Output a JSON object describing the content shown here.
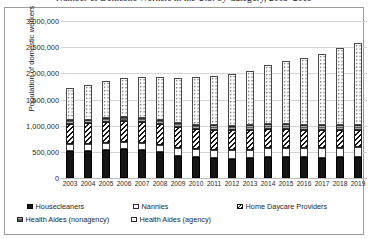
{
  "chart_data": {
    "type": "bar",
    "subtype": "stacked-column",
    "title": "Number of Domestic Workers in the U.S. by Category, 2003–2019",
    "xlabel": "",
    "ylabel": "Population of domestic workers",
    "ylim": [
      0,
      3000000
    ],
    "ytick_labels": [
      "3,000,000",
      "2,500,000",
      "2,000,000",
      "1,500,000",
      "1,000,000",
      "500,000",
      "0"
    ],
    "ytick_values": [
      3000000,
      2500000,
      2000000,
      1500000,
      1000000,
      500000,
      0
    ],
    "grid": true,
    "legend_position": "bottom",
    "categories": [
      "2003",
      "2004",
      "2005",
      "2006",
      "2007",
      "2008",
      "2009",
      "2010",
      "2011",
      "2012",
      "2013",
      "2014",
      "2015",
      "2016",
      "2017",
      "2018",
      "2019"
    ],
    "series": [
      {
        "name": "Housecleaners",
        "pattern": "solid-black",
        "values": [
          520000,
          520000,
          540000,
          545000,
          530000,
          500000,
          430000,
          400000,
          380000,
          370000,
          380000,
          400000,
          410000,
          400000,
          390000,
          400000,
          400000
        ]
      },
      {
        "name": "Nannies",
        "pattern": "white-fine-dot",
        "values": [
          130000,
          130000,
          135000,
          140000,
          140000,
          140000,
          150000,
          155000,
          160000,
          165000,
          165000,
          170000,
          170000,
          170000,
          175000,
          180000,
          185000
        ]
      },
      {
        "name": "Home Daycare Providers",
        "pattern": "diagonal-hatch",
        "values": [
          390000,
          395000,
          400000,
          400000,
          395000,
          390000,
          390000,
          385000,
          380000,
          375000,
          370000,
          365000,
          360000,
          350000,
          345000,
          340000,
          335000
        ]
      },
      {
        "name": "Health Aides (nonagency)",
        "pattern": "gray-fill",
        "values": [
          65000,
          68000,
          70000,
          72000,
          75000,
          78000,
          80000,
          82000,
          85000,
          88000,
          90000,
          92000,
          95000,
          96000,
          98000,
          100000,
          102000
        ]
      },
      {
        "name": "Health Aides (agency)",
        "pattern": "white-dotted",
        "values": [
          620000,
          660000,
          700000,
          760000,
          800000,
          830000,
          860000,
          900000,
          940000,
          990000,
          1050000,
          1130000,
          1210000,
          1280000,
          1360000,
          1470000,
          1560000
        ]
      }
    ],
    "totals": [
      1725000,
      1773000,
      1845000,
      1917000,
      1940000,
      1938000,
      1910000,
      1922000,
      1945000,
      1988000,
      2055000,
      2157000,
      2245000,
      2296000,
      2368000,
      2490000,
      2582000
    ]
  },
  "legend": {
    "items": [
      {
        "label": "Housecleaners"
      },
      {
        "label": "Nannies"
      },
      {
        "label": "Home Daycare Providers"
      },
      {
        "label": "Health Aides (nonagency)"
      },
      {
        "label": "Health Aides (agency)"
      }
    ]
  }
}
